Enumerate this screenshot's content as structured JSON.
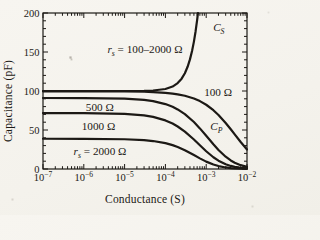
{
  "figure": {
    "ink_color": "#1c1915",
    "paper_color": "#f5f3ed"
  },
  "chart_data": {
    "type": "line",
    "title": "",
    "xlabel": "Conductance (S)",
    "ylabel": "Capacitance (pF)",
    "x_scale": "log",
    "xlim_log": [
      -7,
      -2
    ],
    "ylim": [
      0,
      200
    ],
    "x_tick_base": "10",
    "x_tick_exponents": [
      -7,
      -6,
      -5,
      -4,
      -3,
      -2
    ],
    "y_ticks": [
      0,
      50,
      100,
      150,
      200
    ],
    "y_minor_step": 10,
    "grid": "off",
    "legend": "inline-annotations",
    "series": [
      {
        "id": "cs",
        "name": "C_S",
        "rs_label": "100–2000 Ω",
        "points": [
          [
            1e-07,
            100
          ],
          [
            1e-06,
            100
          ],
          [
            1e-05,
            100.03
          ],
          [
            3e-05,
            100.23
          ],
          [
            5e-05,
            100.63
          ],
          [
            0.0001,
            102.53
          ],
          [
            0.00015,
            105.7
          ],
          [
            0.0002,
            110.13
          ],
          [
            0.00025,
            115.83
          ],
          [
            0.0003,
            122.8
          ],
          [
            0.00035,
            131.03
          ],
          [
            0.0004,
            140.53
          ],
          [
            0.00045,
            151.3
          ],
          [
            0.0005,
            163.34
          ],
          [
            0.00055,
            176.64
          ],
          [
            0.0006,
            191.21
          ],
          [
            0.000628,
            200
          ]
        ]
      },
      {
        "id": "cp-100",
        "name": "C_P",
        "rs_ohm": 100,
        "points": [
          [
            1e-07,
            99.6
          ],
          [
            1e-06,
            99.59
          ],
          [
            1e-05,
            99.41
          ],
          [
            3e-05,
            99.02
          ],
          [
            5e-05,
            98.62
          ],
          [
            0.0001,
            97.65
          ],
          [
            0.00015,
            96.7
          ],
          [
            0.0002,
            95.77
          ],
          [
            0.0003,
            93.89
          ],
          [
            0.0005,
            90.37
          ],
          [
            0.0007,
            87.04
          ],
          [
            0.001,
            82.37
          ],
          [
            0.0015,
            75.4
          ],
          [
            0.002,
            69.25
          ],
          [
            0.003,
            59.04
          ],
          [
            0.004,
            50.92
          ],
          [
            0.005,
            44.36
          ],
          [
            0.007,
            34.55
          ],
          [
            0.01,
            24.98
          ]
        ]
      },
      {
        "id": "cp-500",
        "name": "C_P",
        "rs_ohm": 500,
        "points": [
          [
            1e-07,
            91.01
          ],
          [
            1e-06,
            90.97
          ],
          [
            1e-05,
            90.19
          ],
          [
            3e-05,
            88.58
          ],
          [
            5e-05,
            87.01
          ],
          [
            0.0001,
            83.25
          ],
          [
            0.00015,
            79.72
          ],
          [
            0.0002,
            76.41
          ],
          [
            0.0003,
            70.36
          ],
          [
            0.0005,
            60.2
          ],
          [
            0.0007,
            52.05
          ],
          [
            0.001,
            42.58
          ],
          [
            0.0015,
            31.63
          ],
          [
            0.002,
            24.4
          ],
          [
            0.003,
            15.75
          ],
          [
            0.004,
            10.99
          ],
          [
            0.005,
            8.1
          ],
          [
            0.007,
            4.91
          ],
          [
            0.01,
            2.77
          ]
        ]
      },
      {
        "id": "cp-1000",
        "name": "C_P",
        "rs_ohm": 1000,
        "points": [
          [
            1e-07,
            71.69
          ],
          [
            1e-06,
            71.64
          ],
          [
            1e-05,
            70.68
          ],
          [
            3e-05,
            68.7
          ],
          [
            5e-05,
            66.79
          ],
          [
            0.0001,
            62.31
          ],
          [
            0.00015,
            58.23
          ],
          [
            0.0002,
            54.5
          ],
          [
            0.0003,
            47.97
          ],
          [
            0.0005,
            37.81
          ],
          [
            0.0007,
            30.44
          ],
          [
            0.001,
            22.75
          ],
          [
            0.0015,
            15.05
          ],
          [
            0.002,
            10.64
          ],
          [
            0.003,
            6.1
          ],
          [
            0.004,
            3.94
          ],
          [
            0.005,
            2.75
          ],
          [
            0.007,
            1.55
          ],
          [
            0.01,
            0.82
          ]
        ]
      },
      {
        "id": "cp-2000",
        "name": "C_P",
        "rs_ohm": 2000,
        "points": [
          [
            1e-07,
            38.77
          ],
          [
            1e-06,
            38.71
          ],
          [
            1e-05,
            38.17
          ],
          [
            3e-05,
            37.0
          ],
          [
            5e-05,
            35.85
          ],
          [
            0.0001,
            33.12
          ],
          [
            0.00015,
            30.59
          ],
          [
            0.0002,
            28.26
          ],
          [
            0.0003,
            24.16
          ],
          [
            0.0005,
            17.92
          ],
          [
            0.0007,
            13.63
          ],
          [
            0.001,
            9.45
          ],
          [
            0.0015,
            5.69
          ],
          [
            0.002,
            3.76
          ],
          [
            0.003,
            1.98
          ],
          [
            0.004,
            1.21
          ],
          [
            0.005,
            0.82
          ],
          [
            0.007,
            0.44
          ],
          [
            0.01,
            0.23
          ]
        ]
      }
    ],
    "annotations": [
      {
        "id": "rs-range-label",
        "logx": -4.5,
        "y": 149,
        "anchor": "middle",
        "parts": [
          {
            "t": "r",
            "i": 1
          },
          {
            "t": "s",
            "sub": 1
          },
          {
            "t": " = 100–2000 Ω"
          }
        ]
      },
      {
        "id": "cs-label",
        "logx": -2.83,
        "y": 177,
        "anchor": "start",
        "parts": [
          {
            "t": "C",
            "i": 1
          },
          {
            "t": "S",
            "sub": 1
          }
        ]
      },
      {
        "id": "rs100-label",
        "logx": -3.05,
        "y": 93.5,
        "anchor": "start",
        "parts": [
          {
            "t": "100 Ω"
          }
        ]
      },
      {
        "id": "cp-label",
        "logx": -2.9,
        "y": 50,
        "anchor": "start",
        "parts": [
          {
            "t": "C",
            "i": 1
          },
          {
            "t": "P",
            "sub": 1
          }
        ]
      },
      {
        "id": "rs500-label",
        "logx": -5.95,
        "y": 74,
        "anchor": "start",
        "parts": [
          {
            "t": "500 Ω"
          }
        ]
      },
      {
        "id": "rs1000-label",
        "logx": -6.05,
        "y": 50,
        "anchor": "start",
        "parts": [
          {
            "t": "1000 Ω"
          }
        ]
      },
      {
        "id": "rs2000-label",
        "logx": -6.25,
        "y": 18,
        "anchor": "start",
        "parts": [
          {
            "t": "r",
            "i": 1
          },
          {
            "t": "s",
            "sub": 1
          },
          {
            "t": " = 2000 Ω"
          }
        ]
      }
    ]
  }
}
